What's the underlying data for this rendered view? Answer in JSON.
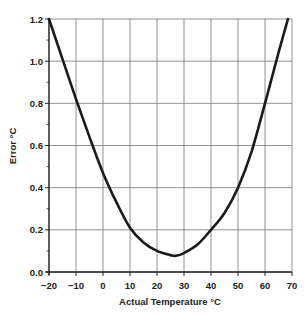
{
  "chart_data": {
    "type": "line",
    "title": "",
    "xlabel": "Actual Temperature °C",
    "ylabel": "Error °C",
    "xlim": [
      -20,
      70
    ],
    "ylim": [
      0,
      1.2
    ],
    "grid": true,
    "legend": null,
    "x_ticks": [
      -20,
      -10,
      0,
      10,
      20,
      30,
      40,
      50,
      60,
      70
    ],
    "x_tick_labels": [
      "−20",
      "−10",
      "0",
      "10",
      "20",
      "30",
      "40",
      "50",
      "60",
      "70"
    ],
    "y_ticks": [
      0.0,
      0.2,
      0.4,
      0.6,
      0.8,
      1.0,
      1.2
    ],
    "y_tick_labels": [
      "0.0",
      "0.2",
      "0.4",
      "0.6",
      "0.8",
      "1.0",
      "1.2"
    ],
    "y_minor_ticks": [
      0.1,
      0.3,
      0.5,
      0.7,
      0.9,
      1.1
    ],
    "series": [
      {
        "name": "Error",
        "color": "#1a1a1a",
        "x": [
          -20,
          -15,
          -10,
          -5,
          0,
          5,
          10,
          15,
          20,
          25,
          27,
          30,
          35,
          40,
          45,
          50,
          55,
          60,
          65,
          68.5
        ],
        "y": [
          1.2,
          1.01,
          0.82,
          0.64,
          0.47,
          0.33,
          0.21,
          0.14,
          0.1,
          0.08,
          0.077,
          0.09,
          0.13,
          0.2,
          0.28,
          0.4,
          0.57,
          0.8,
          1.04,
          1.2
        ]
      }
    ]
  },
  "layout": {
    "plot_left": 49,
    "plot_right": 292,
    "plot_top": 19,
    "plot_bottom": 272,
    "grid_color": "#777777",
    "axis_color": "#222222"
  }
}
